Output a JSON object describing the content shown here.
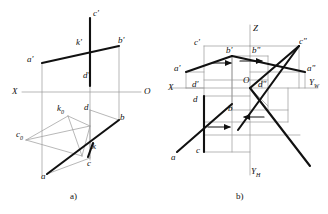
{
  "figure": {
    "caption_a": "a)",
    "caption_b": "b)",
    "stroke_color": "#1a1a1a",
    "thin_color": "#8a8a8a",
    "background": "#ffffff"
  },
  "panel_a": {
    "title": "spatial view",
    "axis_labels": {
      "x_left": "X",
      "origin_right": "O"
    },
    "points": [
      {
        "name": "a-prime",
        "label": "a'",
        "x": 27,
        "y": 60
      },
      {
        "name": "b-prime",
        "label": "b'",
        "x": 118,
        "y": 42
      },
      {
        "name": "c-prime",
        "label": "c'",
        "x": 92,
        "y": 11
      },
      {
        "name": "k-prime",
        "label": "k'",
        "x": 79,
        "y": 44
      },
      {
        "name": "d-prime",
        "label": "d'",
        "x": 85,
        "y": 77
      },
      {
        "name": "d",
        "label": "d",
        "x": 85,
        "y": 109
      },
      {
        "name": "b",
        "label": "b",
        "x": 119,
        "y": 119
      },
      {
        "name": "c",
        "label": "c",
        "x": 87,
        "y": 162
      },
      {
        "name": "k",
        "label": "k",
        "x": 88,
        "y": 148
      },
      {
        "name": "a",
        "label": "a",
        "x": 42,
        "y": 176
      },
      {
        "name": "c-zero",
        "label": "c",
        "sub": "0",
        "x": 17,
        "y": 134
      },
      {
        "name": "k-zero",
        "label": "k",
        "sub": "0",
        "x": 57,
        "y": 110
      }
    ]
  },
  "panel_b": {
    "title": "orthographic epure",
    "axis_labels": {
      "z_top": "Z",
      "x_left": "X",
      "y_w_right": "Y",
      "y_w_sub": "W",
      "y_h_bottom": "Y",
      "y_h_sub": "H",
      "origin": "O"
    },
    "points": [
      {
        "name": "c-prime",
        "label": "c'",
        "x": 205,
        "y": 40
      },
      {
        "name": "b-prime",
        "label": "b'",
        "x": 230,
        "y": 50
      },
      {
        "name": "b-double-prime",
        "label": "b\"",
        "x": 256,
        "y": 50
      },
      {
        "name": "c-double-prime",
        "label": "c\"",
        "x": 299,
        "y": 39
      },
      {
        "name": "a-prime",
        "label": "a'",
        "x": 176,
        "y": 70
      },
      {
        "name": "a-double-prime",
        "label": "a\"",
        "x": 308,
        "y": 69
      },
      {
        "name": "origin",
        "label": "O",
        "x": 252,
        "y": 82
      },
      {
        "name": "d-prime",
        "label": "d'",
        "x": 205,
        "y": 84
      },
      {
        "name": "d-double-prime",
        "label": "d\"",
        "x": 261,
        "y": 85
      },
      {
        "name": "d",
        "label": "d",
        "x": 205,
        "y": 99
      },
      {
        "name": "b-h",
        "label": "b",
        "x": 231,
        "y": 110
      },
      {
        "name": "c-h",
        "label": "c",
        "x": 205,
        "y": 150
      },
      {
        "name": "a-h",
        "label": "a",
        "x": 175,
        "y": 157
      }
    ],
    "arrow_count": 4,
    "arrow_direction": "right"
  }
}
